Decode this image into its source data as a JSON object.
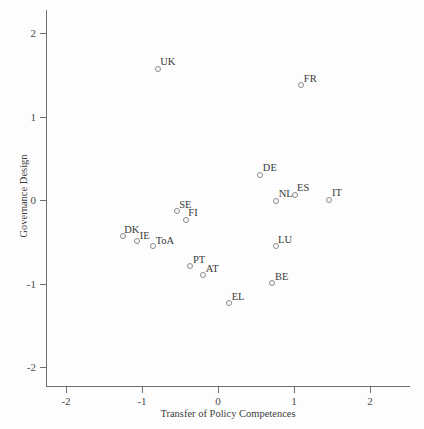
{
  "chart_data": {
    "type": "scatter",
    "title": "",
    "xlabel": "Transfer of Policy Competences",
    "ylabel": "Governance Design",
    "xlim": [
      -2.27,
      2.52
    ],
    "ylim": [
      -2.25,
      2.27
    ],
    "xticks": [
      -2,
      -1,
      0,
      1,
      2
    ],
    "xtick_labels": [
      "-2",
      "-1",
      "0",
      "1",
      "2"
    ],
    "yticks": [
      -2,
      -1,
      0,
      1,
      2
    ],
    "ytick_labels": [
      "-2",
      "-1",
      "0",
      "1",
      "2"
    ],
    "grid": false,
    "legend": null,
    "marker_style": "open-circle",
    "points": [
      {
        "label": "UK",
        "x": -0.8,
        "y": 1.58,
        "label_dx": 3,
        "label_dy": -12
      },
      {
        "label": "FR",
        "x": 1.09,
        "y": 1.38,
        "label_dx": 3,
        "label_dy": -12
      },
      {
        "label": "DE",
        "x": 0.55,
        "y": 0.31,
        "label_dx": 3,
        "label_dy": -12
      },
      {
        "label": "ES",
        "x": 1.0,
        "y": 0.07,
        "label_dx": 3,
        "label_dy": -12
      },
      {
        "label": "IT",
        "x": 1.46,
        "y": 0.01,
        "label_dx": 3,
        "label_dy": -12
      },
      {
        "label": "NL",
        "x": 0.76,
        "y": 0.0,
        "label_dx": 3,
        "label_dy": -12
      },
      {
        "label": "SE",
        "x": -0.55,
        "y": -0.13,
        "label_dx": 3,
        "label_dy": -12
      },
      {
        "label": "FI",
        "x": -0.43,
        "y": -0.23,
        "label_dx": 3,
        "label_dy": -12
      },
      {
        "label": "DK",
        "x": -1.26,
        "y": -0.43,
        "label_dx": 2,
        "label_dy": -12
      },
      {
        "label": "IE",
        "x": -1.07,
        "y": -0.48,
        "label_dx": 3,
        "label_dy": -10
      },
      {
        "label": "ToA",
        "x": -0.86,
        "y": -0.54,
        "label_dx": 3,
        "label_dy": -10
      },
      {
        "label": "LU",
        "x": 0.75,
        "y": -0.55,
        "label_dx": 3,
        "label_dy": -12
      },
      {
        "label": "PT",
        "x": -0.37,
        "y": -0.79,
        "label_dx": 3,
        "label_dy": -12
      },
      {
        "label": "AT",
        "x": -0.2,
        "y": -0.89,
        "label_dx": 3,
        "label_dy": -11
      },
      {
        "label": "BE",
        "x": 0.71,
        "y": -0.99,
        "label_dx": 3,
        "label_dy": -12
      },
      {
        "label": "EL",
        "x": 0.14,
        "y": -1.23,
        "label_dx": 3,
        "label_dy": -12
      }
    ]
  }
}
